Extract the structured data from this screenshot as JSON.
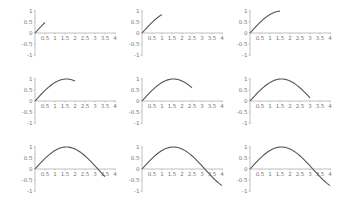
{
  "chart_data": [
    {
      "type": "line",
      "title": "",
      "function": "sin(x)",
      "x_end": 0.5,
      "xlim": [
        0,
        4
      ],
      "ylim": [
        -1,
        1
      ],
      "xticks": [
        "0.5",
        "1",
        "1.5",
        "2",
        "2.5",
        "3",
        "3.5",
        "4"
      ],
      "yticks": [
        "1",
        "0.5",
        "0",
        "-0.5",
        "-1"
      ],
      "x": [
        0,
        0.1,
        0.2,
        0.3,
        0.4,
        0.5
      ],
      "y": [
        0,
        0.1,
        0.199,
        0.296,
        0.389,
        0.479
      ]
    },
    {
      "type": "line",
      "title": "",
      "function": "sin(x)",
      "x_end": 1.0,
      "xlim": [
        0,
        4
      ],
      "ylim": [
        -1,
        1
      ],
      "xticks": [
        "0.5",
        "1",
        "1.5",
        "2",
        "2.5",
        "3",
        "3.5",
        "4"
      ],
      "yticks": [
        "1",
        "0.5",
        "0",
        "-0.5",
        "-1"
      ],
      "x": [
        0,
        0.25,
        0.5,
        0.75,
        1.0
      ],
      "y": [
        0,
        0.247,
        0.479,
        0.682,
        0.841
      ]
    },
    {
      "type": "line",
      "title": "",
      "function": "sin(x)",
      "x_end": 1.5,
      "xlim": [
        0,
        4
      ],
      "ylim": [
        -1,
        1
      ],
      "xticks": [
        "0.5",
        "1",
        "1.5",
        "2",
        "2.5",
        "3",
        "3.5",
        "4"
      ],
      "yticks": [
        "1",
        "0.5",
        "0",
        "-0.5",
        "-1"
      ],
      "x": [
        0,
        0.5,
        1.0,
        1.5
      ],
      "y": [
        0,
        0.479,
        0.841,
        0.997
      ]
    },
    {
      "type": "line",
      "title": "",
      "function": "sin(x)",
      "x_end": 2.0,
      "xlim": [
        0,
        4
      ],
      "ylim": [
        -1,
        1
      ],
      "xticks": [
        "0.5",
        "1",
        "1.5",
        "2",
        "2.5",
        "3",
        "3.5",
        "4"
      ],
      "yticks": [
        "1",
        "0.5",
        "0",
        "-0.5",
        "-1"
      ],
      "x": [
        0,
        0.5,
        1.0,
        1.5,
        2.0
      ],
      "y": [
        0,
        0.479,
        0.841,
        0.997,
        0.909
      ]
    },
    {
      "type": "line",
      "title": "",
      "function": "sin(x)",
      "x_end": 2.5,
      "xlim": [
        0,
        4
      ],
      "ylim": [
        -1,
        1
      ],
      "xticks": [
        "0.5",
        "1",
        "1.5",
        "2",
        "2.5",
        "3",
        "3.5",
        "4"
      ],
      "yticks": [
        "1",
        "0.5",
        "0",
        "-0.5",
        "-1"
      ],
      "x": [
        0,
        0.5,
        1.0,
        1.5,
        2.0,
        2.5
      ],
      "y": [
        0,
        0.479,
        0.841,
        0.997,
        0.909,
        0.598
      ]
    },
    {
      "type": "line",
      "title": "",
      "function": "sin(x)",
      "x_end": 3.0,
      "xlim": [
        0,
        4
      ],
      "ylim": [
        -1,
        1
      ],
      "xticks": [
        "0.5",
        "1",
        "1.5",
        "2",
        "2.5",
        "3",
        "3.5",
        "4"
      ],
      "yticks": [
        "1",
        "0.5",
        "0",
        "-0.5",
        "-1"
      ],
      "x": [
        0,
        0.5,
        1.0,
        1.5,
        2.0,
        2.5,
        3.0
      ],
      "y": [
        0,
        0.479,
        0.841,
        0.997,
        0.909,
        0.598,
        0.141
      ]
    },
    {
      "type": "line",
      "title": "",
      "function": "sin(x)",
      "x_end": 3.5,
      "xlim": [
        0,
        4
      ],
      "ylim": [
        -1,
        1
      ],
      "xticks": [
        "0.5",
        "1",
        "1.5",
        "2",
        "2.5",
        "3",
        "3.5",
        "4"
      ],
      "yticks": [
        "1",
        "0.5",
        "0",
        "-0.5",
        "-1"
      ],
      "x": [
        0,
        0.5,
        1.0,
        1.5,
        2.0,
        2.5,
        3.0,
        3.5
      ],
      "y": [
        0,
        0.479,
        0.841,
        0.997,
        0.909,
        0.598,
        0.141,
        -0.351
      ]
    },
    {
      "type": "line",
      "title": "",
      "function": "sin(x)",
      "x_end": 4.0,
      "xlim": [
        0,
        4
      ],
      "ylim": [
        -1,
        1
      ],
      "xticks": [
        "0.5",
        "1",
        "1.5",
        "2",
        "2.5",
        "3",
        "3.5",
        "4"
      ],
      "yticks": [
        "1",
        "0.5",
        "0",
        "-0.5",
        "-1"
      ],
      "x": [
        0,
        0.5,
        1.0,
        1.5,
        2.0,
        2.5,
        3.0,
        3.5,
        4.0
      ],
      "y": [
        0,
        0.479,
        0.841,
        0.997,
        0.909,
        0.598,
        0.141,
        -0.351,
        -0.757
      ]
    },
    {
      "type": "line",
      "title": "",
      "function": "sin(x)",
      "x_end": 4.0,
      "xlim": [
        0,
        4
      ],
      "ylim": [
        -1,
        1
      ],
      "xticks": [
        "0.5",
        "1",
        "1.5",
        "2",
        "2.5",
        "3",
        "3.5",
        "4"
      ],
      "yticks": [
        "1",
        "0.5",
        "0",
        "-0.5",
        "-1"
      ],
      "x": [
        0,
        0.5,
        1.0,
        1.5,
        2.0,
        2.5,
        3.0,
        3.5,
        4.0
      ],
      "y": [
        0,
        0.479,
        0.841,
        0.997,
        0.909,
        0.598,
        0.141,
        -0.351,
        -0.757
      ]
    }
  ],
  "layout": {
    "rows": 3,
    "cols": 3,
    "axis_color": "#b0b0b0",
    "line_color": "#555555",
    "tick_label_color": "#777777"
  }
}
